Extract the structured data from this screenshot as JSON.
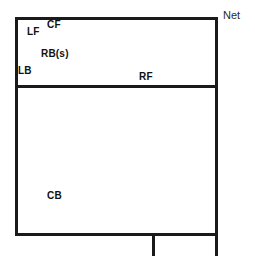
{
  "diagram": {
    "net_label": "Net",
    "court": {
      "outline_color": "#1a1a1a",
      "background_color": "#ffffff"
    },
    "positions": [
      {
        "id": "lf",
        "label": "LF",
        "zone": "front"
      },
      {
        "id": "cf",
        "label": "CF",
        "zone": "front"
      },
      {
        "id": "rbs",
        "label": "RB(s)",
        "zone": "front"
      },
      {
        "id": "lb",
        "label": "LB",
        "zone": "front"
      },
      {
        "id": "rf",
        "label": "RF",
        "zone": "front"
      },
      {
        "id": "cb",
        "label": "CB",
        "zone": "back"
      }
    ]
  }
}
